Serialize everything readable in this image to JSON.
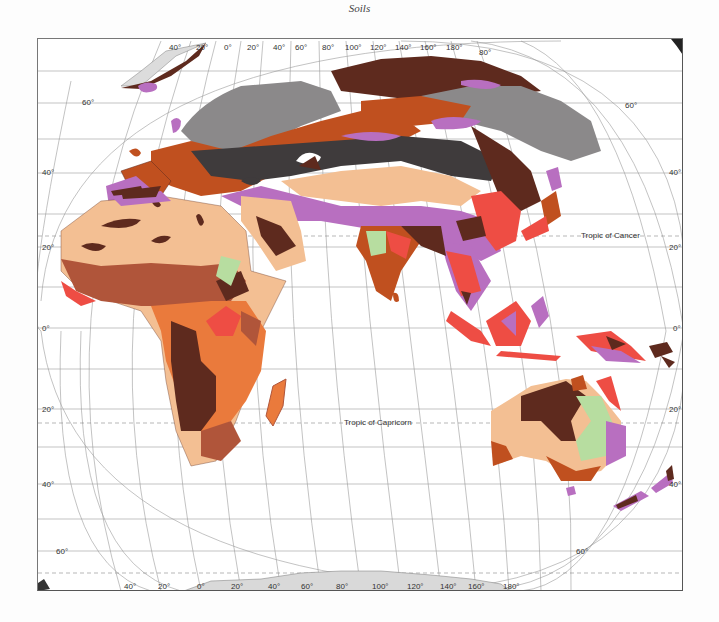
{
  "title": "Soils",
  "tropics": {
    "cancer": "Tropic of Cancer",
    "capricorn": "Tropic of Capricorn"
  },
  "latitude_labels": {
    "left": [
      "60°",
      "40°",
      "20°",
      "0°",
      "20°",
      "40°",
      "60°"
    ],
    "right": [
      "60°",
      "40°",
      "20°",
      "0°",
      "20°",
      "40°",
      "60°"
    ]
  },
  "longitude_labels": {
    "top": [
      "40°",
      "20°",
      "0°",
      "20°",
      "40°",
      "60°",
      "80°",
      "100°",
      "120°",
      "140°",
      "160°",
      "180°"
    ],
    "top_extra": "80°",
    "bottom": [
      "40°",
      "20°",
      "0°",
      "20°",
      "40°",
      "60°",
      "80°",
      "100°",
      "120°",
      "140°",
      "160°",
      "180°"
    ]
  },
  "soil_colors": {
    "desert_light": "#f3bf93",
    "dark_brown": "#5e2a1e",
    "chestnut": "#b0553a",
    "orange": "#ea7a3c",
    "red": "#ee4d44",
    "purple": "#b86fc0",
    "dark_gray": "#3f3b3c",
    "gray": "#8b898a",
    "rust": "#c0501f",
    "light_green": "#b7dda0",
    "ice": "#dcdcdc"
  }
}
